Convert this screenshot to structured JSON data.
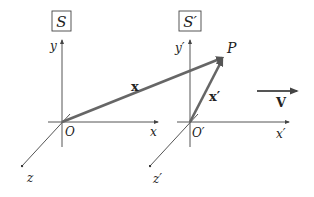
{
  "frames": [
    {
      "name": "S",
      "title": "S",
      "origin_label": "O",
      "axes": {
        "x": "x",
        "y": "y",
        "z": "z"
      }
    },
    {
      "name": "S-prime",
      "title": "S′",
      "origin_label": "O′",
      "axes": {
        "x": "x′",
        "y": "y′",
        "z": "z′"
      }
    }
  ],
  "point": {
    "label": "P"
  },
  "vectors": {
    "position_in_S": {
      "label": "x"
    },
    "position_in_S_prime": {
      "label": "x′"
    },
    "velocity": {
      "label": "V"
    }
  },
  "colors": {
    "axis": "#555555",
    "vector": "#666666",
    "text": "#222222",
    "background": "#ffffff"
  }
}
